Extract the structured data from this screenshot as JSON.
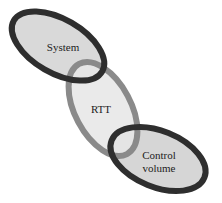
{
  "diagram": {
    "nodes": [
      {
        "id": "system",
        "label": "System",
        "lines": [
          "System"
        ],
        "stroke": "#2e2e2e",
        "fill": "#d9d9d9"
      },
      {
        "id": "rtt",
        "label": "RTT",
        "lines": [
          "RTT"
        ],
        "stroke": "#8a8a8a",
        "fill": "#e6e6e6"
      },
      {
        "id": "control-volume",
        "label": "Control volume",
        "lines": [
          "Control",
          "volume"
        ],
        "stroke": "#2e2e2e",
        "fill": "#d6d6d6"
      }
    ],
    "links": [
      {
        "from": "system",
        "to": "rtt"
      },
      {
        "from": "rtt",
        "to": "control-volume"
      }
    ]
  }
}
